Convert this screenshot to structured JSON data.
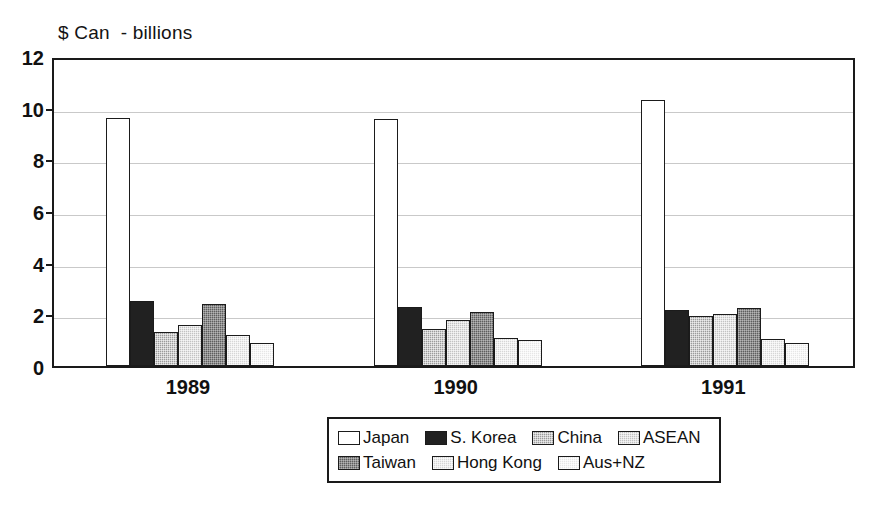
{
  "chart_data": {
    "type": "bar",
    "title": "$ Can  - billions",
    "xlabel": "",
    "ylabel": "",
    "ylim": [
      0,
      12
    ],
    "y_ticks": [
      0,
      2,
      4,
      6,
      8,
      10,
      12
    ],
    "grid": true,
    "legend_position": "bottom",
    "categories": [
      "1989",
      "1990",
      "1991"
    ],
    "series": [
      {
        "name": "Japan",
        "fill": "white",
        "values": [
          9.6,
          9.55,
          10.3
        ]
      },
      {
        "name": "S. Korea",
        "fill": "black",
        "values": [
          2.5,
          2.3,
          2.15
        ]
      },
      {
        "name": "China",
        "fill": "midgray",
        "values": [
          1.3,
          1.45,
          1.95
        ]
      },
      {
        "name": "ASEAN",
        "fill": "lightgray",
        "values": [
          1.6,
          1.8,
          2.0
        ]
      },
      {
        "name": "Taiwan",
        "fill": "darkgray",
        "values": [
          2.4,
          2.1,
          2.25
        ]
      },
      {
        "name": "Hong Kong",
        "fill": "paleicegray",
        "values": [
          1.2,
          1.1,
          1.05
        ]
      },
      {
        "name": "Aus+NZ",
        "fill": "palest",
        "values": [
          0.9,
          1.0,
          0.9
        ]
      }
    ]
  },
  "axis": {
    "y_tick_labels": [
      "12",
      "10",
      "8",
      "6",
      "4",
      "2",
      "0"
    ],
    "x_tick_labels": [
      "1989",
      "1990",
      "1991"
    ]
  },
  "legend": {
    "row1": [
      {
        "label": "Japan",
        "fill": "white"
      },
      {
        "label": "S. Korea",
        "fill": "black"
      },
      {
        "label": "China",
        "fill": "midgray"
      },
      {
        "label": "ASEAN",
        "fill": "lightgray"
      }
    ],
    "row2": [
      {
        "label": "Taiwan",
        "fill": "darkgray"
      },
      {
        "label": "Hong Kong",
        "fill": "paleicegray"
      },
      {
        "label": "Aus+NZ",
        "fill": "palest"
      }
    ]
  },
  "colors": {
    "axis": "#1a1a1a",
    "grid": "#c9c9c9",
    "text": "#111111",
    "background": "#ffffff"
  }
}
